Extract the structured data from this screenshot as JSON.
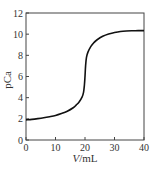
{
  "chart_data": {
    "type": "line",
    "title": "",
    "xlabel": "V/mL",
    "ylabel": "pCa",
    "xlim": [
      0,
      40
    ],
    "ylim": [
      0,
      12
    ],
    "xticks": [
      0,
      10,
      20,
      30,
      40
    ],
    "yticks": [
      0,
      2,
      4,
      6,
      8,
      10,
      12
    ],
    "grid": false,
    "legend": null,
    "series": [
      {
        "name": "titration curve",
        "x": [
          0,
          2,
          4,
          6,
          8,
          10,
          12,
          14,
          16,
          17,
          18,
          19,
          19.5,
          19.8,
          20,
          20.2,
          20.5,
          21,
          22,
          23,
          24,
          26,
          28,
          30,
          32,
          34,
          36,
          38,
          40
        ],
        "y": [
          1.9,
          1.95,
          2.02,
          2.1,
          2.2,
          2.32,
          2.5,
          2.72,
          3.05,
          3.3,
          3.6,
          4.05,
          4.5,
          5.2,
          6.0,
          7.0,
          7.8,
          8.3,
          8.85,
          9.2,
          9.45,
          9.8,
          10.02,
          10.15,
          10.25,
          10.3,
          10.32,
          10.33,
          10.33
        ]
      }
    ]
  },
  "labels": {
    "xlabel_italic": "V",
    "xlabel_rest": "/mL",
    "ylabel": "pCa"
  }
}
